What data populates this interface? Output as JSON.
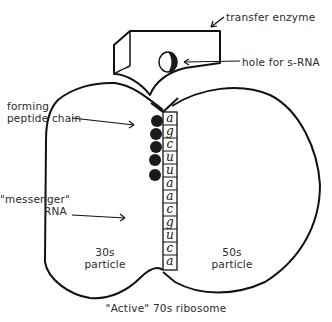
{
  "diagram": {
    "title": "\"Active\" 70s ribosome",
    "labels": {
      "transfer_enzyme": "transfer enzyme",
      "hole": "hole for s-RNA",
      "peptide_line1": "forming",
      "peptide_line2": "peptide chain",
      "messenger_line1": "\"messenger\"",
      "messenger_line2": "RNA",
      "small_sub_line1": "30s",
      "small_sub_line2": "particle",
      "large_sub_line1": "50s",
      "large_sub_line2": "particle"
    },
    "mrna_bases": [
      "a",
      "g",
      "c",
      "u",
      "u",
      "a",
      "a",
      "c",
      "g",
      "u",
      "c",
      "a"
    ],
    "peptide_bead_count": 5,
    "colors": {
      "ink": "#111111",
      "text": "#2a2a2a",
      "background": "#ffffff"
    }
  }
}
